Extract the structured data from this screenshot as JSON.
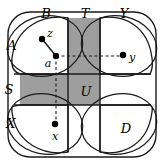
{
  "figure": {
    "kind": "set-theoretic venn-like diagram",
    "canvas": {
      "width": 164,
      "height": 165
    },
    "colors": {
      "stroke": "#1a1a1a",
      "shaded_fill": "#9e9e9e",
      "background": "#ffffff",
      "dashed_stroke": "#1a1a1a",
      "point_fill": "#000000"
    },
    "outer_frame": {
      "x": 8,
      "y": 12,
      "width": 148,
      "height": 145,
      "corner_radius": 22
    },
    "grid": {
      "vertical_strip": {
        "x1": 68,
        "x2": 100
      },
      "horizontal_band": {
        "y1": 74,
        "y2": 105
      }
    },
    "shaded_regions": [
      {
        "name": "top-vertical-strip",
        "x": 68,
        "y": 18,
        "width": 32,
        "height": 56
      },
      {
        "name": "left-horizontal-band",
        "x": 20,
        "y": 74,
        "width": 48,
        "height": 31
      },
      {
        "name": "center-square-U",
        "x": 68,
        "y": 74,
        "width": 32,
        "height": 31
      }
    ],
    "white_regions": [
      {
        "name": "right-horizontal-band",
        "x": 100,
        "y": 74,
        "width": 52,
        "height": 31
      },
      {
        "name": "bottom-vertical-strip",
        "x": 68,
        "y": 105,
        "width": 32,
        "height": 48
      }
    ],
    "region_labels": [
      {
        "id": "A",
        "text": "A",
        "x": 12,
        "y": 45
      },
      {
        "id": "B",
        "text": "B",
        "x": 46,
        "y": 13
      },
      {
        "id": "T",
        "text": "T",
        "x": 85,
        "y": 13
      },
      {
        "id": "Y",
        "text": "Y",
        "x": 124,
        "y": 13
      },
      {
        "id": "S",
        "text": "S",
        "x": 9,
        "y": 89
      },
      {
        "id": "U",
        "text": "U",
        "x": 86,
        "y": 91
      },
      {
        "id": "X",
        "text": "X",
        "x": 11,
        "y": 123
      },
      {
        "id": "D",
        "text": "D",
        "x": 126,
        "y": 128
      }
    ],
    "points": [
      {
        "id": "z",
        "label": "z",
        "cx": 42,
        "cy": 39,
        "label_x": 50,
        "label_y": 33
      },
      {
        "id": "a",
        "label": "a",
        "cx": 56,
        "cy": 56,
        "label_x": 48,
        "label_y": 63
      },
      {
        "id": "y",
        "label": "y",
        "cx": 123,
        "cy": 55,
        "label_x": 132,
        "label_y": 57
      },
      {
        "id": "x",
        "label": "x",
        "cx": 55,
        "cy": 124,
        "label_x": 55,
        "label_y": 136
      }
    ],
    "connector_solid": {
      "from": "z",
      "to": "a",
      "x1": 42,
      "y1": 39,
      "x2": 56,
      "y2": 56
    },
    "connector_dashed": [
      {
        "name": "a-to-y-horizontal",
        "x1": 56,
        "y1": 56,
        "x2": 123,
        "y2": 56
      },
      {
        "name": "a-to-x-vertical",
        "x1": 56,
        "y1": 56,
        "x2": 56,
        "y2": 124
      }
    ],
    "petals": [
      {
        "name": "top-left-petal-B"
      },
      {
        "name": "top-right-petal-Y"
      },
      {
        "name": "bottom-left-petal-X"
      },
      {
        "name": "bottom-right-petal-D"
      }
    ]
  }
}
